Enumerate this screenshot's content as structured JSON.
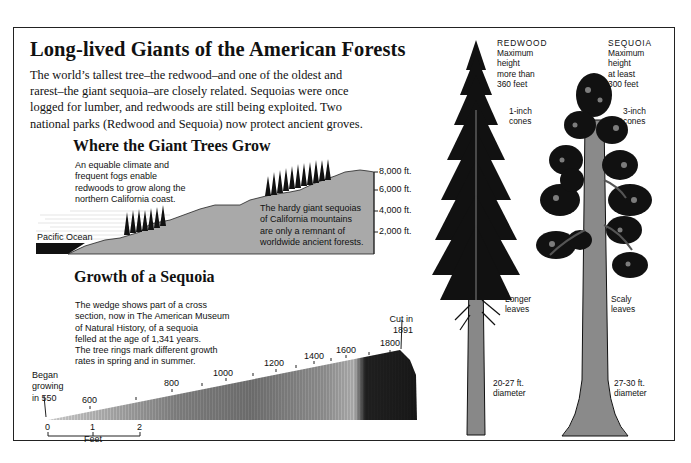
{
  "title": "Long-lived Giants of the American Forests",
  "intro": [
    "The world’s tallest tree–the redwood–and one of the oldest and",
    "rarest–the giant sequoia–are closely related. Sequoias were once",
    "logged for lumber, and redwoods are still being exploited. Two",
    "national parks (Redwood and Sequoia) now protect ancient groves."
  ],
  "where_section": {
    "heading": "Where the Giant Trees Grow",
    "coast_note": [
      "An equable climate and",
      "frequent fogs enable",
      "redwoods to grow along the",
      "northern California coast."
    ],
    "ocean_label": "Pacific Ocean",
    "mountain_note": [
      "The hardy giant sequoias",
      "of California mountains",
      "are only a remnant of",
      "worldwide ancient forests."
    ],
    "elevation_ticks": [
      "8,000 ft.",
      "6,000 ft.",
      "4,000 ft.",
      "2,000 ft."
    ],
    "colors": {
      "land": "#a9a9a9",
      "ocean": "#111111",
      "trees": "#111111"
    }
  },
  "growth_section": {
    "heading": "Growth of a Sequoia",
    "note": [
      "The wedge shows part of a cross",
      "section, now in The American Museum",
      "of Natural History, of a sequoia",
      "felled at the age of 1,341 years.",
      "The tree rings mark different growth",
      "rates in spring and in summer."
    ],
    "start_label": [
      "Began",
      "growing",
      "in 550"
    ],
    "end_label": [
      "Cut in",
      "1891"
    ],
    "year_labels": [
      "600",
      "800",
      "1000",
      "1200",
      "1400",
      "1600",
      "1800"
    ],
    "scale": {
      "ticks": [
        "0",
        "1",
        "2"
      ],
      "unit": "Feet"
    }
  },
  "trees": {
    "redwood": {
      "name": "REDWOOD",
      "height_note": [
        "Maximum",
        "height",
        "more than",
        "360 feet"
      ],
      "cones_note": [
        "1-inch",
        "cones"
      ],
      "leaves_note": [
        "Longer",
        "leaves"
      ],
      "diameter_note": [
        "20-27 ft.",
        "diameter"
      ]
    },
    "sequoia": {
      "name": "SEQUOIA",
      "height_note": [
        "Maximum",
        "height",
        "at least",
        "300 feet"
      ],
      "cones_note": [
        "3-inch",
        "cones"
      ],
      "leaves_note": [
        "Scaly",
        "leaves"
      ],
      "diameter_note": [
        "27-30 ft.",
        "diameter"
      ]
    }
  }
}
